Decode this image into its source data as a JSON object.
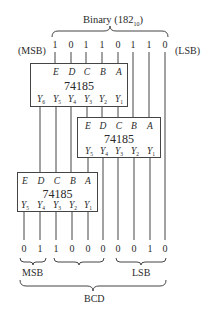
{
  "top": {
    "brace_label": "Binary (182",
    "brace_label_sub": "10",
    "brace_label_close": ")",
    "msb_label": "(MSB)",
    "lsb_label": "(LSB)",
    "bits": [
      "1",
      "0",
      "1",
      "1",
      "0",
      "1",
      "1",
      "0"
    ]
  },
  "chips": [
    {
      "part": "74185",
      "inputs": [
        "E",
        "D",
        "C",
        "B",
        "A"
      ],
      "outputs": [
        [
          "Y",
          "6"
        ],
        [
          "Y",
          "5"
        ],
        [
          "Y",
          "4"
        ],
        [
          "Y",
          "3"
        ],
        [
          "Y",
          "2"
        ],
        [
          "Y",
          "1"
        ]
      ]
    },
    {
      "part": "74185",
      "inputs": [
        "E",
        "D",
        "C",
        "B",
        "A"
      ],
      "outputs": [
        [
          "Y",
          "5"
        ],
        [
          "Y",
          "4"
        ],
        [
          "Y",
          "3"
        ],
        [
          "Y",
          "2"
        ],
        [
          "Y",
          "1"
        ]
      ]
    },
    {
      "part": "74185",
      "inputs": [
        "E",
        "D",
        "C",
        "B",
        "A"
      ],
      "outputs": [
        [
          "Y",
          "5"
        ],
        [
          "Y",
          "4"
        ],
        [
          "Y",
          "3"
        ],
        [
          "Y",
          "2"
        ],
        [
          "Y",
          "1"
        ]
      ]
    }
  ],
  "bottom": {
    "bits": [
      "0",
      "1",
      "1",
      "0",
      "0",
      "0",
      "0",
      "0",
      "1",
      "0"
    ],
    "msb_label": "MSB",
    "lsb_label": "LSB",
    "bcd_label": "BCD"
  },
  "colors": {
    "line": "#444444",
    "text": "#2a2a2a",
    "background": "#ffffff"
  }
}
